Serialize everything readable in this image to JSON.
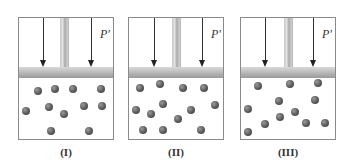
{
  "panels": [
    {
      "label": "(I)",
      "pressure_label": "P'",
      "left": 18,
      "molecules": [
        [
          19,
          13
        ],
        [
          36,
          11
        ],
        [
          54,
          11
        ],
        [
          82,
          11
        ],
        [
          7,
          33
        ],
        [
          30,
          29
        ],
        [
          65,
          28
        ],
        [
          83,
          28
        ],
        [
          45,
          36
        ],
        [
          32,
          53
        ],
        [
          70,
          53
        ]
      ]
    },
    {
      "label": "(II)",
      "pressure_label": "P'",
      "left": 128,
      "molecules": [
        [
          11,
          10
        ],
        [
          31,
          6
        ],
        [
          54,
          10
        ],
        [
          75,
          10
        ],
        [
          34,
          26
        ],
        [
          86,
          27
        ],
        [
          7,
          32
        ],
        [
          22,
          36
        ],
        [
          62,
          32
        ],
        [
          49,
          41
        ],
        [
          14,
          52
        ],
        [
          34,
          52
        ],
        [
          72,
          52
        ]
      ]
    },
    {
      "label": "(III)",
      "pressure_label": "P'",
      "left": 240,
      "molecules": [
        [
          17,
          8
        ],
        [
          49,
          6
        ],
        [
          77,
          5
        ],
        [
          38,
          23
        ],
        [
          74,
          22
        ],
        [
          7,
          31
        ],
        [
          54,
          34
        ],
        [
          39,
          39
        ],
        [
          24,
          46
        ],
        [
          65,
          45
        ],
        [
          84,
          45
        ],
        [
          7,
          54
        ]
      ]
    }
  ],
  "colors": {
    "border": "#8a8a8a",
    "molecule": "#5a5a5a",
    "piston": "#bdbdbd",
    "arrow": "#333333"
  }
}
